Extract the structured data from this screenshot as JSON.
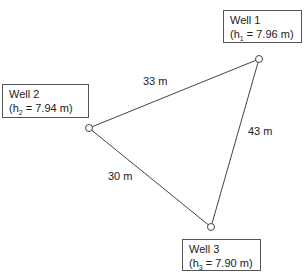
{
  "wells": [
    {
      "name": "Well 1",
      "head_symbol": "h",
      "head_subscript": "1",
      "head_value": "7.96 m",
      "x": 259,
      "y": 59
    },
    {
      "name": "Well 2",
      "head_symbol": "h",
      "head_subscript": "2",
      "head_value": "7.94 m",
      "x": 89,
      "y": 128
    },
    {
      "name": "Well 3",
      "head_symbol": "h",
      "head_subscript": "3",
      "head_value": "7.90 m",
      "x": 211,
      "y": 227
    }
  ],
  "distances": [
    {
      "from": "Well 2",
      "to": "Well 1",
      "label": "33 m"
    },
    {
      "from": "Well 1",
      "to": "Well 3",
      "label": "43 m"
    },
    {
      "from": "Well 2",
      "to": "Well 3",
      "label": "30 m"
    }
  ],
  "colors": {
    "line": "#444444",
    "text": "#222222",
    "box_border": "#555555"
  }
}
